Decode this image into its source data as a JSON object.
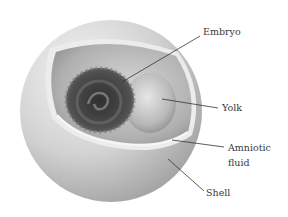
{
  "diagram": {
    "labels": [
      {
        "id": "embryo",
        "text": "Embryo",
        "x": 203,
        "y": 26
      },
      {
        "id": "yolk",
        "text": "Yolk",
        "x": 222,
        "y": 102
      },
      {
        "id": "amniotic_fluid",
        "text_line1": "Amniotic",
        "text_line2": "fluid",
        "x": 228,
        "y": 142
      },
      {
        "id": "shell",
        "text": "Shell",
        "x": 206,
        "y": 187
      }
    ],
    "colors": {
      "shell_light": "#f2f2f2",
      "shell_mid": "#c8c8c8",
      "shell_dark": "#9a9a9a",
      "interior": "#bdbdbd",
      "embryo": "#4a4a4a",
      "yolk": "#d6d6d6",
      "leader_line": "#333333",
      "label_text": "#3a3a3a"
    }
  }
}
